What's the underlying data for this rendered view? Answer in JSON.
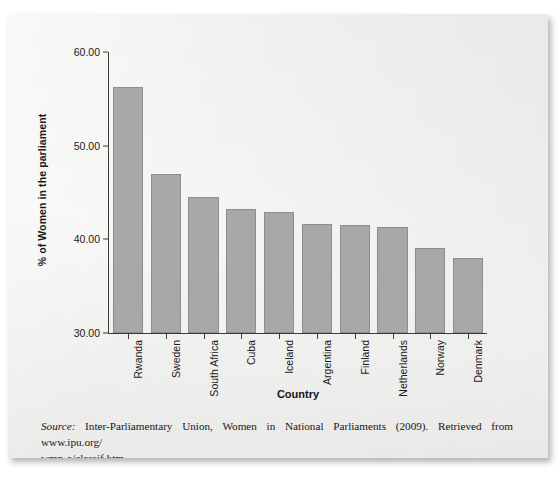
{
  "chart_data": {
    "type": "bar",
    "title": "",
    "xlabel": "Country",
    "ylabel": "% of Women in the parliament",
    "categories": [
      "Rwanda",
      "Sweden",
      "South Africa",
      "Cuba",
      "Iceland",
      "Argentina",
      "Finland",
      "Netherlands",
      "Norway",
      "Denmark"
    ],
    "values": [
      56.3,
      47.0,
      44.5,
      43.2,
      42.9,
      41.6,
      41.5,
      41.3,
      39.1,
      38.0
    ],
    "ylim": [
      30.0,
      60.0
    ],
    "ytick_labels": [
      "30.00",
      "40.00",
      "50.00",
      "60.00"
    ],
    "ytick_values": [
      30.0,
      40.0,
      50.0,
      60.0
    ],
    "grid": false,
    "legend": false,
    "bar_color": "#a8a8a8",
    "bar_border_color": "#8d8d8d",
    "axis_color": "#3a3a3a"
  },
  "caption": {
    "source_label": "Source:",
    "source_text": " Inter-Parliamentary Union, Women in National Parliaments (2009). Retrieved from www.ipu.org/",
    "source_line2": "wmn-e/classif.htm."
  }
}
